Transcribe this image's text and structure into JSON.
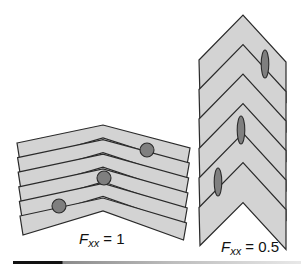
{
  "figure": {
    "type": "diagram",
    "colors": {
      "layer_fill": "#d3d3d3",
      "layer_stroke": "#2a2a2a",
      "marker_fill": "#7f7f7f",
      "marker_stroke": "#2a2a2a",
      "background": "#ffffff"
    },
    "panels": [
      {
        "id": "left",
        "label_symbol": "F",
        "label_subscript": "xx",
        "label_value": "= 1",
        "layers": 6,
        "marker_shape": "circle",
        "markers": [
          {
            "cx": 147,
            "cy": 150
          },
          {
            "cx": 104,
            "cy": 178
          },
          {
            "cx": 59,
            "cy": 206
          }
        ]
      },
      {
        "id": "right",
        "label_symbol": "F",
        "label_subscript": "xx",
        "label_value": "= 0.5",
        "layers": 6,
        "marker_shape": "ellipse",
        "markers": [
          {
            "cx": 265,
            "cy": 64
          },
          {
            "cx": 241,
            "cy": 130
          },
          {
            "cx": 218,
            "cy": 182
          }
        ]
      }
    ]
  }
}
